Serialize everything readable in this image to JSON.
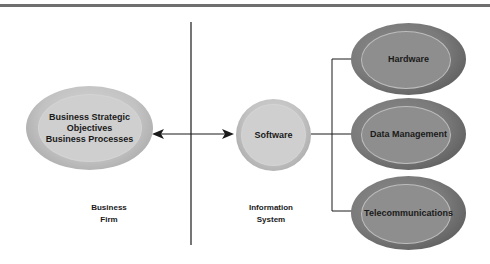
{
  "diagram": {
    "left_node": {
      "lines": [
        "Business Strategic",
        "Objectives",
        "Business Processes"
      ]
    },
    "center_node": {
      "label": "Software"
    },
    "right_nodes": [
      {
        "label": "Hardware"
      },
      {
        "label": "Data Management"
      },
      {
        "label": "Telecommunications"
      }
    ],
    "section_labels": {
      "left": [
        "Business",
        "Firm"
      ],
      "right": [
        "Information",
        "System"
      ]
    },
    "connector": {
      "type": "bidirectional-arrow"
    },
    "colors": {
      "light_node": "#c8c8c8",
      "dark_node": "#7e7e7e",
      "line": "#1a1a1a",
      "top_rule": "#6e6e6e"
    }
  }
}
